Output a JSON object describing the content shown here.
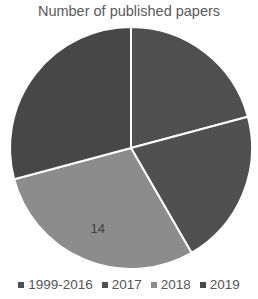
{
  "chart_data": {
    "type": "pie",
    "title": "Number of published papers",
    "categories": [
      "1999-2016",
      "2017",
      "2018",
      "2019"
    ],
    "values": [
      10,
      10,
      14,
      14
    ],
    "colors": [
      "#4f4f4f",
      "#505050",
      "#8c8c8c",
      "#474747"
    ],
    "data_labels": [
      "",
      "",
      "14",
      ""
    ],
    "legend_position": "bottom",
    "start_angle_deg": 0,
    "direction": "clockwise"
  },
  "legend": {
    "items": [
      {
        "label": "1999-2016",
        "color": "#4f4f4f"
      },
      {
        "label": "2017",
        "color": "#505050"
      },
      {
        "label": "2018",
        "color": "#8c8c8c"
      },
      {
        "label": "2019",
        "color": "#474747"
      }
    ]
  }
}
